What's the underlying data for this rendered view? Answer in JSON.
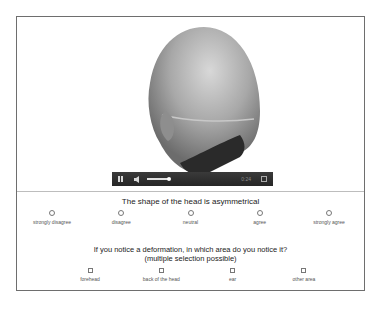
{
  "video": {
    "subject": "3D head model rotating, viewed from back-left",
    "controls": {
      "play_state": "pause-icon",
      "volume": "volume-icon",
      "progress_percent": 15,
      "time": "0:24",
      "fullscreen": "fullscreen-icon"
    }
  },
  "question1": {
    "title": "The shape of the head is asymmetrical",
    "options": [
      {
        "label": "strongly disagree"
      },
      {
        "label": "disagree"
      },
      {
        "label": "neutral"
      },
      {
        "label": "agree"
      },
      {
        "label": "strongly agree"
      }
    ]
  },
  "question2": {
    "title": "If you notice a deformation, in which area do you notice it?",
    "subtitle": "(multiple selection possible)",
    "options": [
      {
        "label": "forehead"
      },
      {
        "label": "back of the head"
      },
      {
        "label": "ear"
      },
      {
        "label": "other area"
      }
    ]
  },
  "colors": {
    "frame_border": "#6e6e6e",
    "player_bg": "#2e2e2e",
    "head_shade": "#9a9a9a"
  }
}
